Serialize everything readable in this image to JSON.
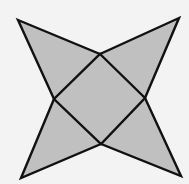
{
  "diagram": {
    "type": "geometric-figure",
    "colors": {
      "background": "#f3f3f3",
      "fill": "#c0c0c0",
      "stroke": "#111111"
    },
    "stroke_width": 2.4,
    "outer_tips": [
      {
        "name": "top-left",
        "x": 18,
        "y": 20
      },
      {
        "name": "top-right",
        "x": 179,
        "y": 18
      },
      {
        "name": "bottom-right",
        "x": 181,
        "y": 176
      },
      {
        "name": "bottom-left",
        "x": 21,
        "y": 178
      }
    ],
    "inner_square": [
      {
        "name": "top",
        "x": 100,
        "y": 54
      },
      {
        "name": "right",
        "x": 145,
        "y": 98
      },
      {
        "name": "bottom",
        "x": 101,
        "y": 144
      },
      {
        "name": "left",
        "x": 54,
        "y": 99
      }
    ]
  }
}
